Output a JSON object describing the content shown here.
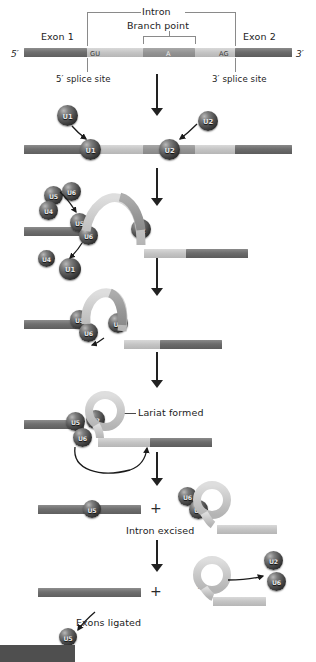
{
  "figure": {
    "type": "biological-process-diagram"
  },
  "top_diagram": {
    "five_prime": "5′",
    "three_prime": "3′",
    "exon1_label": "Exon 1",
    "exon2_label": "Exon 2",
    "intron_label": "Intron",
    "branch_point_label": "Branch point",
    "five_splice_site_label": "5′ splice site",
    "three_splice_site_label": "3′ splice site",
    "sequence_markers": {
      "donor": "GU",
      "branch": "A",
      "acceptor": "AG"
    }
  },
  "steps": [
    {
      "id": "step-1-u1-u2-binding",
      "snrnps": [
        "U1",
        "U1",
        "U2",
        "U2"
      ]
    },
    {
      "id": "step-2-tri-snrnp-recruitment",
      "snrnps": [
        "U5",
        "U6",
        "U4",
        "U5",
        "U6",
        "U2",
        "U4",
        "U1"
      ]
    },
    {
      "id": "step-3-loop-formation",
      "snrnps": [
        "U5",
        "U6",
        "U2"
      ]
    },
    {
      "id": "step-4-lariat",
      "label": "Lariat formed",
      "snrnps": [
        "U5",
        "U2",
        "U6"
      ]
    },
    {
      "id": "step-5-intron-excised",
      "label": "Intron excised",
      "plus": "+",
      "snrnps": [
        "U5",
        "U6",
        "U2"
      ]
    },
    {
      "id": "step-6-exons-ligated",
      "label": "Exons ligated",
      "plus": "+",
      "branch_marker": "A",
      "snrnps": [
        "U5",
        "U2",
        "U6"
      ]
    }
  ],
  "colors": {
    "exon": "#6f6f6f",
    "intron": "#c4c4c4",
    "branch_point": "#949494",
    "snrnp": "#2b2b2b",
    "text": "#1c1c1c",
    "arrow": "#222222"
  }
}
